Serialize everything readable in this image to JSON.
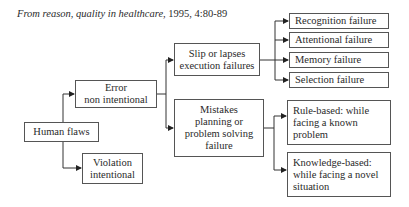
{
  "title": {
    "italic_part": "From reason, quality in healthcare,",
    "plain_part": " 1995, 4:80-89"
  },
  "nodes": {
    "human_flaws": {
      "lines": [
        "Human flaws"
      ]
    },
    "error": {
      "lines": [
        "Error",
        "non intentional"
      ]
    },
    "violation": {
      "lines": [
        "Violation",
        "intentional"
      ]
    },
    "slip": {
      "lines": [
        "Slip or lapses",
        "execution failures"
      ]
    },
    "mistakes": {
      "lines": [
        "Mistakes",
        "planning or",
        "problem solving",
        "failure"
      ]
    },
    "recognition": {
      "lines": [
        "Recognition failure"
      ]
    },
    "attentional": {
      "lines": [
        "Attentional failure"
      ]
    },
    "memory": {
      "lines": [
        "Memory failure"
      ]
    },
    "selection": {
      "lines": [
        "Selection failure"
      ]
    },
    "rule_based": {
      "lines": [
        "Rule-based: while",
        "facing a known",
        "problem"
      ]
    },
    "knowledge_based": {
      "lines": [
        "Knowledge-based:",
        "while facing a novel",
        "situation"
      ]
    }
  },
  "colors": {
    "line": "#333333",
    "border": "#555555",
    "text": "#2a2a2a"
  }
}
